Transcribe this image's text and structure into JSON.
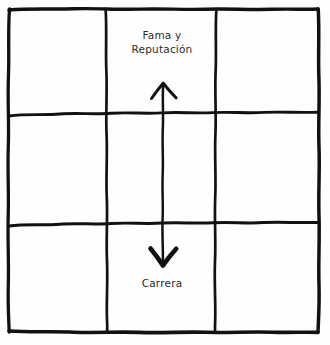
{
  "diagram": {
    "type": "hand-drawn-3x3-grid-with-vertical-double-arrow",
    "background_color": "#fefefe",
    "ink_color": "#111111",
    "text_color": "#2b2b2b",
    "labels": {
      "top": "Fama y\nReputación",
      "top_line_1": "Fama y",
      "top_line_2": "Reputación",
      "bottom": "Carrera"
    },
    "grid": {
      "rows": 3,
      "columns": 3,
      "outer_bounds": {
        "left": 8,
        "top": 8,
        "right": 318,
        "bottom": 332
      },
      "vertical_divider_x": [
        106,
        216
      ],
      "horizontal_divider_y": [
        114,
        224
      ]
    },
    "arrow": {
      "orientation": "vertical",
      "double_headed": true,
      "shaft_x": 163,
      "top_tip_y": 83,
      "bottom_tip_y": 266,
      "points_to_top_label": "Fama y Reputación",
      "points_to_bottom_label": "Carrera"
    }
  }
}
